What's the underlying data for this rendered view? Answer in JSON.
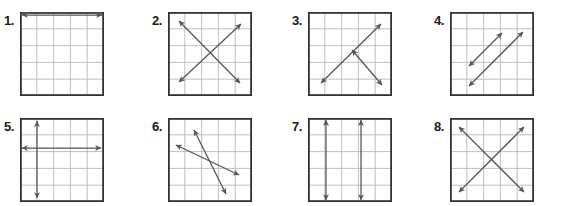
{
  "worksheet": {
    "title": "Parallel, Perpendicular, and Intersecting Lines Worksheet",
    "grid_rows": 5,
    "grid_cols": 5,
    "colors": {
      "grid_line": "#b9b9b9",
      "border": "#333333",
      "figure_line": "#555555",
      "label_text": "#1a1a1a",
      "background": "#ffffff"
    },
    "problems": [
      {
        "number": "1.",
        "name": "problem-1",
        "relationship": "parallel-horizontal",
        "lines": [
          {
            "x1": 2,
            "y1": 1,
            "x2": 82,
            "y2": 1,
            "arrows": "both"
          },
          {
            "x1": 2,
            "y1": 3,
            "x2": 82,
            "y2": 3,
            "arrows": "both"
          }
        ]
      },
      {
        "number": "2.",
        "name": "problem-2",
        "relationship": "intersecting-x",
        "lines": [
          {
            "x1": 11,
            "y1": 9,
            "x2": 72,
            "y2": 71,
            "arrows": "both"
          },
          {
            "x1": 11,
            "y1": 70,
            "x2": 73,
            "y2": 12,
            "arrows": "both"
          }
        ]
      },
      {
        "number": "3.",
        "name": "problem-3",
        "relationship": "intersecting",
        "lines": [
          {
            "x1": 13,
            "y1": 71,
            "x2": 73,
            "y2": 12,
            "arrows": "both"
          },
          {
            "x1": 44,
            "y1": 38,
            "x2": 74,
            "y2": 73,
            "arrows": "both"
          }
        ]
      },
      {
        "number": "4.",
        "name": "problem-4",
        "relationship": "parallel-diagonal",
        "lines": [
          {
            "x1": 19,
            "y1": 54,
            "x2": 52,
            "y2": 21,
            "arrows": "both"
          },
          {
            "x1": 19,
            "y1": 74,
            "x2": 73,
            "y2": 20,
            "arrows": "both"
          }
        ]
      },
      {
        "number": "5.",
        "name": "problem-5",
        "relationship": "perpendicular",
        "lines": [
          {
            "x1": 17,
            "y1": 3,
            "x2": 17,
            "y2": 80,
            "arrows": "both"
          },
          {
            "x1": 2,
            "y1": 30,
            "x2": 81,
            "y2": 30,
            "arrows": "both"
          }
        ]
      },
      {
        "number": "6.",
        "name": "problem-6",
        "relationship": "intersecting",
        "lines": [
          {
            "x1": 8,
            "y1": 27,
            "x2": 71,
            "y2": 57,
            "arrows": "both"
          },
          {
            "x1": 26,
            "y1": 12,
            "x2": 58,
            "y2": 76,
            "arrows": "both"
          }
        ]
      },
      {
        "number": "7.",
        "name": "problem-7",
        "relationship": "parallel-vertical",
        "lines": [
          {
            "x1": 18,
            "y1": 2,
            "x2": 18,
            "y2": 82,
            "arrows": "both"
          },
          {
            "x1": 53,
            "y1": 2,
            "x2": 53,
            "y2": 82,
            "arrows": "both"
          }
        ]
      },
      {
        "number": "8.",
        "name": "problem-8",
        "relationship": "intersecting-x",
        "lines": [
          {
            "x1": 9,
            "y1": 9,
            "x2": 74,
            "y2": 74,
            "arrows": "both"
          },
          {
            "x1": 9,
            "y1": 74,
            "x2": 74,
            "y2": 9,
            "arrows": "both"
          }
        ]
      }
    ]
  }
}
